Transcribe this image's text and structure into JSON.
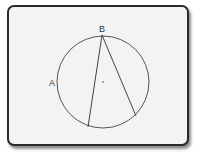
{
  "diagram": {
    "type": "circle-geometry",
    "colors": {
      "background": "#f3f3f1",
      "border": "#2a2a2a",
      "stroke": "#555555",
      "center": "#c0a0a0"
    },
    "circle": {
      "cx": 103,
      "cy": 82,
      "r": 46
    },
    "points": [
      {
        "label": "A",
        "x": 57,
        "y": 83,
        "label_x": 49,
        "label_y": 86
      },
      {
        "label": "B",
        "x": 102,
        "y": 35,
        "label_x": 99,
        "label_y": 32
      }
    ],
    "center_marker": {
      "x": 103,
      "y": 82
    },
    "chords": [
      {
        "from": [
          102,
          35
        ],
        "to": [
          88,
          127
        ]
      },
      {
        "from": [
          102,
          35
        ],
        "to": [
          136,
          116
        ]
      }
    ]
  }
}
